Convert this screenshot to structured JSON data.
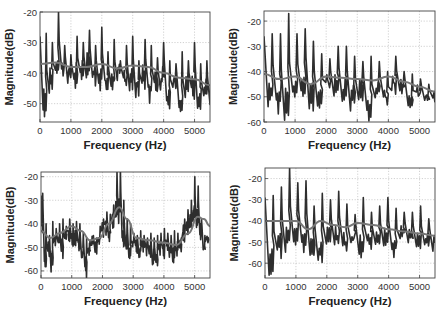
{
  "colors": {
    "spectrum": "#2e2e2e",
    "envelope": "#777777",
    "grid": "#bdbdbd",
    "axis": "#444444",
    "background": "#ffffff"
  },
  "chart_data": [
    {
      "type": "line",
      "position": "top-left",
      "box": [
        40,
        12,
        210,
        122
      ],
      "xlabel": "Frequency (Hz)",
      "ylabel": "Magnitude(dB)",
      "xlim": [
        0,
        5500
      ],
      "ylim": [
        -56,
        -20
      ],
      "xticks": [
        0,
        1000,
        2000,
        3000,
        4000,
        5000
      ],
      "yticks": [
        -20,
        -30,
        -40,
        -50
      ],
      "grid": true,
      "f0": 200,
      "peaks_db": [
        -27,
        -30,
        -20,
        -31,
        -34,
        -28,
        -30,
        -26,
        -31,
        -25,
        -33,
        -29,
        -36,
        -31,
        -28,
        -36,
        -29,
        -31,
        -35,
        -30,
        -36,
        -37,
        -33,
        -36,
        -30,
        -37,
        -36,
        -39,
        -41,
        -40,
        -41,
        -38,
        -40,
        -35,
        -38,
        -39,
        -44
      ],
      "troughs_db": [
        -55,
        -47,
        -43,
        -42,
        -44,
        -46,
        -43,
        -42,
        -45,
        -46,
        -48,
        -47,
        -44,
        -46,
        -47,
        -48,
        -46,
        -50,
        -47,
        -46,
        -52,
        -46,
        -55,
        -48,
        -49,
        -52,
        -50,
        -51,
        -53,
        -54,
        -50,
        -52,
        -53,
        -50,
        -54,
        -55,
        -52
      ],
      "series": [
        {
          "name": "spectrum",
          "style": "dark thick line"
        },
        {
          "name": "envelope",
          "style": "gray smooth line",
          "x": [
            0,
            500,
            1000,
            1500,
            2000,
            2500,
            3000,
            3500,
            4000,
            4500,
            5000,
            5500
          ],
          "y": [
            -37,
            -36.5,
            -38,
            -38,
            -37,
            -38.5,
            -37.5,
            -38,
            -40,
            -41.5,
            -42,
            -44
          ]
        }
      ]
    },
    {
      "type": "line",
      "position": "top-right",
      "box": [
        264,
        11,
        435,
        122
      ],
      "xlabel": "Frequency (Hz)",
      "ylabel": "Magnitude(dB)",
      "xlim": [
        0,
        5500
      ],
      "ylim": [
        -60,
        -16
      ],
      "xticks": [
        0,
        1000,
        2000,
        3000,
        4000,
        5000
      ],
      "yticks": [
        -20,
        -30,
        -40,
        -50,
        -60
      ],
      "grid": true,
      "f0": 265,
      "peaks_db": [
        -25,
        -25,
        -17,
        -25,
        -23,
        -28,
        -33,
        -35,
        -30,
        -30,
        -34,
        -36,
        -34,
        -36,
        -40,
        -34,
        -40,
        -41,
        -43,
        -45,
        -47
      ],
      "troughs_db": [
        -54,
        -57,
        -60,
        -53,
        -50,
        -56,
        -57,
        -49,
        -51,
        -53,
        -56,
        -52,
        -60,
        -52,
        -56,
        -49,
        -50,
        -58,
        -52,
        -54,
        -53
      ],
      "series": [
        {
          "name": "spectrum",
          "style": "dark thick line"
        },
        {
          "name": "envelope",
          "style": "gray smooth line",
          "x": [
            0,
            500,
            1000,
            1500,
            2000,
            2500,
            3000,
            3500,
            4000,
            4500,
            5000,
            5500
          ],
          "y": [
            -41,
            -43,
            -42,
            -45,
            -42,
            -42.5,
            -43,
            -43.5,
            -42,
            -44,
            -46,
            -48
          ]
        }
      ]
    },
    {
      "type": "line",
      "position": "bottom-left",
      "box": [
        41,
        172,
        210,
        278
      ],
      "xlabel": "Frequency (Hz)",
      "ylabel": "Magnitude(dB)",
      "xlim": [
        0,
        5500
      ],
      "ylim": [
        -63,
        -18
      ],
      "xticks": [
        0,
        1000,
        2000,
        3000,
        4000,
        5000
      ],
      "yticks": [
        -20,
        -30,
        -40,
        -50,
        -60
      ],
      "grid": true,
      "f0": 110,
      "peaks_db": [
        -27,
        -40,
        -45,
        -39,
        -42,
        -40,
        -38,
        -41,
        -38,
        -40,
        -39,
        -40,
        -44,
        -46,
        -47,
        -45,
        -46,
        -41,
        -38,
        -35,
        -36,
        -32,
        -18,
        -17,
        -30,
        -38,
        -40,
        -44,
        -45,
        -43,
        -45,
        -46,
        -44,
        -46,
        -45,
        -44,
        -42,
        -44,
        -45,
        -43,
        -44,
        -46,
        -38,
        -34,
        -30,
        -20,
        -24,
        -38,
        -45,
        -46
      ],
      "troughs_db": [
        -44,
        -61,
        -55,
        -61,
        -50,
        -52,
        -55,
        -49,
        -48,
        -52,
        -50,
        -53,
        -56,
        -63,
        -55,
        -52,
        -54,
        -50,
        -46,
        -45,
        -48,
        -42,
        -38,
        -40,
        -50,
        -52,
        -58,
        -52,
        -53,
        -55,
        -52,
        -54,
        -56,
        -58,
        -61,
        -54,
        -55,
        -52,
        -55,
        -58,
        -55,
        -52,
        -48,
        -45,
        -44,
        -40,
        -42,
        -47,
        -54,
        -50
      ],
      "series": [
        {
          "name": "spectrum",
          "style": "dark thick line"
        },
        {
          "name": "envelope",
          "style": "gray smooth line",
          "x": [
            0,
            300,
            600,
            1000,
            1300,
            1600,
            1900,
            2200,
            2550,
            2800,
            3100,
            3500,
            4000,
            4400,
            4800,
            5100,
            5300,
            5500
          ],
          "y": [
            -43,
            -46,
            -44,
            -41,
            -43,
            -47,
            -46,
            -40,
            -33,
            -38,
            -46,
            -47,
            -48,
            -49,
            -44,
            -37,
            -38,
            -41
          ]
        }
      ]
    },
    {
      "type": "line",
      "position": "bottom-right",
      "box": [
        265,
        168,
        435,
        278
      ],
      "xlabel": "Frequency (Hz)",
      "ylabel": "Magnitude(dB)",
      "xlim": [
        0,
        5500
      ],
      "ylim": [
        -67,
        -15
      ],
      "xticks": [
        0,
        1000,
        2000,
        3000,
        4000,
        5000
      ],
      "yticks": [
        -20,
        -30,
        -40,
        -50,
        -60
      ],
      "grid": true,
      "f0": 265,
      "peaks_db": [
        -28,
        -24,
        -15,
        -22,
        -21,
        -33,
        -27,
        -30,
        -26,
        -32,
        -37,
        -29,
        -36,
        -33,
        -29,
        -34,
        -36,
        -36,
        -33,
        -39,
        -38,
        -40
      ],
      "troughs_db": [
        -66,
        -58,
        -55,
        -52,
        -56,
        -58,
        -62,
        -52,
        -54,
        -56,
        -52,
        -59,
        -54,
        -53,
        -55,
        -58,
        -50,
        -53,
        -56,
        -52,
        -56,
        -55
      ],
      "series": [
        {
          "name": "spectrum",
          "style": "dark thick line"
        },
        {
          "name": "envelope",
          "style": "gray smooth line",
          "x": [
            0,
            500,
            1000,
            1400,
            1800,
            2200,
            2600,
            3000,
            3500,
            4000,
            4500,
            5000,
            5500
          ],
          "y": [
            -40,
            -40,
            -40,
            -44,
            -40,
            -42,
            -43,
            -41,
            -42,
            -44,
            -45,
            -46,
            -47
          ]
        }
      ]
    }
  ]
}
